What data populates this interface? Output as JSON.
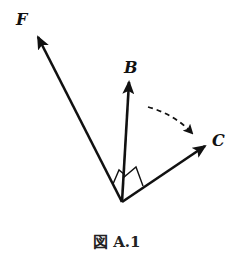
{
  "figure": {
    "caption": "図 A.1",
    "caption_prefix": "図",
    "caption_number": "A.1"
  },
  "vectors": [
    {
      "id": "F",
      "label": "F",
      "origin": [
        122,
        202
      ],
      "tip": [
        36,
        33
      ]
    },
    {
      "id": "B",
      "label": "B",
      "origin": [
        122,
        202
      ],
      "tip": [
        129,
        78
      ]
    },
    {
      "id": "C",
      "label": "C",
      "origin": [
        122,
        202
      ],
      "tip": [
        209,
        143
      ]
    }
  ],
  "annotations": {
    "right_angle_markers": [
      "F-B",
      "B-C"
    ],
    "rotation_arrow": {
      "style": "dashed",
      "from": "B",
      "to": "C",
      "direction": "clockwise"
    }
  },
  "colors": {
    "stroke": "#111111",
    "background": "#ffffff"
  }
}
